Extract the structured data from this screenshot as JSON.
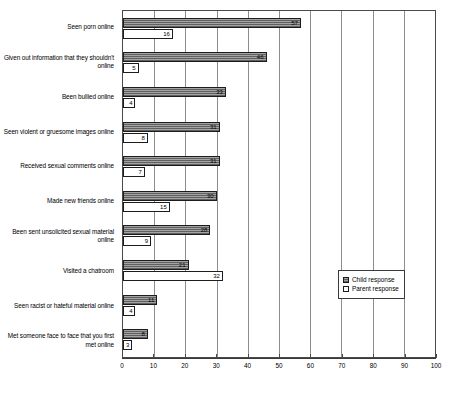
{
  "chart_data": {
    "type": "bar",
    "orientation": "horizontal",
    "title": "",
    "xlabel": "",
    "ylabel": "",
    "xlim": [
      0,
      100
    ],
    "xticks": [
      0,
      10,
      20,
      30,
      40,
      50,
      60,
      70,
      80,
      90,
      100
    ],
    "grid": true,
    "legend_position": "right-middle",
    "categories": [
      "Seen porn online",
      "Given out information that they shouldn't online",
      "Been bullied online",
      "Seen violent or gruesome images online",
      "Received sexual comments online",
      "Made new friends online",
      "Been sent unsolicited sexual material online",
      "Visited a chatroom",
      "Seen racist or hateful material online",
      "Met someone face to face that you first met online"
    ],
    "series": [
      {
        "name": "Child response",
        "color": "#8a8a8a",
        "values": [
          57,
          46,
          33,
          31,
          31,
          30,
          28,
          21,
          11,
          8
        ]
      },
      {
        "name": "Parent response",
        "color": "#ffffff",
        "values": [
          16,
          5,
          4,
          8,
          7,
          15,
          9,
          32,
          4,
          3
        ]
      }
    ]
  },
  "legend": {
    "items": [
      {
        "label": "Child response",
        "swatch": "child"
      },
      {
        "label": "Parent response",
        "swatch": "parent"
      }
    ]
  }
}
